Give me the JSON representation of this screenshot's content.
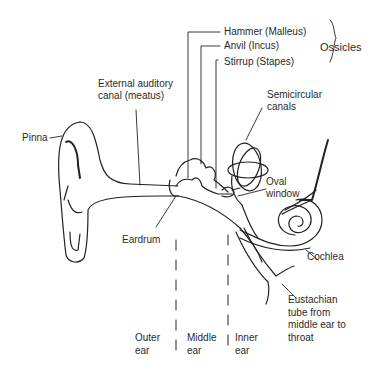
{
  "diagram": {
    "labels": {
      "hammer": "Hammer (Malleus)",
      "anvil": "Anvil (Incus)",
      "stirrup": "Stirrup (Stapes)",
      "ossicles": "Ossicles",
      "external_canal": [
        "External auditory",
        "canal (meatus)"
      ],
      "pinna": "Pinna",
      "semicircular": [
        "Semicircular",
        "canals"
      ],
      "oval_window": [
        "Oval",
        "window"
      ],
      "eardrum": "Eardrum",
      "cochlea": "Cochlea",
      "eustachian": [
        "Eustachian",
        "tube from",
        "middle ear to",
        "throat"
      ]
    },
    "regions": {
      "outer": [
        "Outer",
        "ear"
      ],
      "middle": [
        "Middle",
        "ear"
      ],
      "inner": [
        "Inner",
        "ear"
      ]
    },
    "colors": {
      "line": "#222222",
      "text": "#2a2a2a",
      "background": "#ffffff"
    }
  }
}
